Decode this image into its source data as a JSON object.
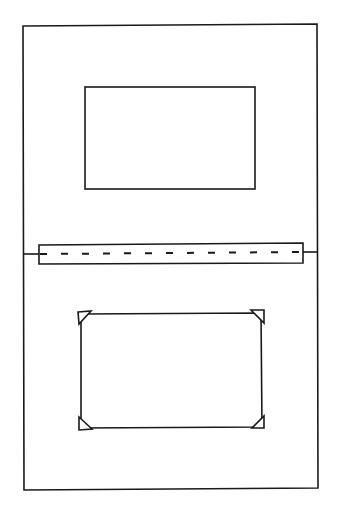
{
  "diagram": {
    "colors": {
      "stroke": "#1a1a1a",
      "background": "#ffffff"
    },
    "outer_frame": {
      "x": 23,
      "y": 24,
      "w": 295,
      "h": 208,
      "x2": 318,
      "y2": 488
    },
    "top_window": {
      "x": 85,
      "y": 87,
      "w": 170,
      "h": 102
    },
    "hinge_strip": {
      "x": 39,
      "y": 243,
      "w": 264,
      "h": 21,
      "fold_line_y": 253,
      "tab_left": {
        "x1": 23,
        "x2": 39,
        "y": 254
      },
      "tab_right": {
        "x1": 303,
        "x2": 318,
        "y": 252
      },
      "dash_count": 13
    },
    "bottom_photo": {
      "x": 80,
      "y": 313,
      "w": 181,
      "h": 114,
      "corner_mounts": [
        {
          "position": "top-left",
          "label": "corner-mount"
        },
        {
          "position": "top-right",
          "label": "corner-mount"
        },
        {
          "position": "bottom-left",
          "label": "corner-mount"
        },
        {
          "position": "bottom-right",
          "label": "corner-mount"
        }
      ],
      "mount_size": 13
    }
  }
}
